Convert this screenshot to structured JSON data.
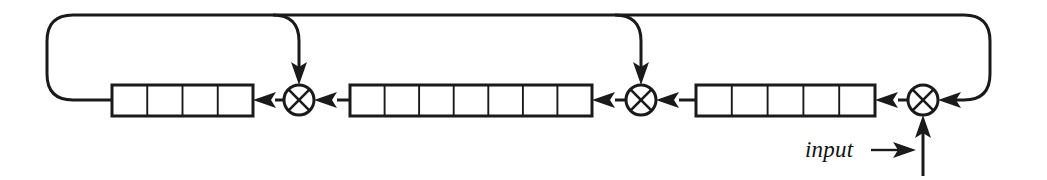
{
  "figure": {
    "name": "linear-feedback-shift-register-diagram",
    "type": "block-diagram",
    "background_color": "#ffffff",
    "line_color": "#1a1a1a",
    "width": 1047,
    "height": 180
  },
  "labels": {
    "input": "input"
  },
  "registers": [
    {
      "id": "register-left",
      "cells": 4,
      "x": 112,
      "y": 85,
      "width": 141,
      "height": 31
    },
    {
      "id": "register-middle",
      "cells": 7,
      "x": 350,
      "y": 85,
      "width": 242,
      "height": 31
    },
    {
      "id": "register-right",
      "cells": 5,
      "x": 696,
      "y": 85,
      "width": 179,
      "height": 31
    }
  ],
  "xor_gates": [
    {
      "id": "xor-gate-1",
      "cx": 299,
      "cy": 100,
      "r": 15
    },
    {
      "id": "xor-gate-2",
      "cx": 641,
      "cy": 100,
      "r": 15
    },
    {
      "id": "xor-gate-3",
      "cx": 923,
      "cy": 100,
      "r": 15
    }
  ],
  "feedback_line": {
    "y": 15,
    "x_start": 47,
    "x_end": 990,
    "corner_radius": 26,
    "tap_points": [
      299,
      641
    ]
  },
  "input_signal": {
    "label_x": 805,
    "label_y": 157,
    "arrow_from_x": 880,
    "arrow_to_x": 915,
    "vertical_line_x": 923,
    "vertical_line_bottom": 176
  }
}
